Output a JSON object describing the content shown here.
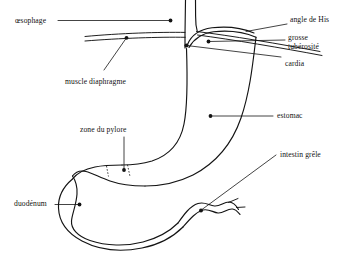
{
  "figure": {
    "language": "fr",
    "background_color": "#ffffff",
    "line_color": "#141414"
  },
  "labels": {
    "oesophage": "œsophage",
    "angle_de_his": "angle de His",
    "grosse_tuberosite_line1": "grosse",
    "grosse_tuberosite_line2": "tubérosité",
    "cardia": "cardia",
    "muscle_diaphragme": "muscle diaphragme",
    "estomac": "estomac",
    "zone_du_pylore": "zone du pylore",
    "intestin_grele": "intestin grêle",
    "duodenum": "duodénum"
  }
}
